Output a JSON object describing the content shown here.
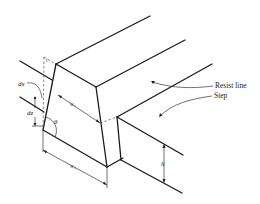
{
  "figure": {
    "labels": {
      "resist_line": "Resist line",
      "step": "Step",
      "dx": "dx",
      "dz": "dz",
      "theta": "θ",
      "w1": "w₁",
      "w2": "w₂",
      "h": "h",
      "t": "t"
    }
  }
}
